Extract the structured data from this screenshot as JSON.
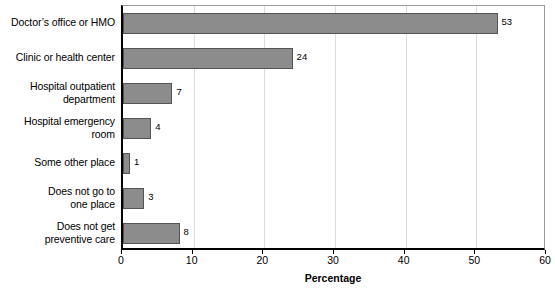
{
  "chart_data": {
    "type": "bar",
    "orientation": "horizontal",
    "title": "",
    "subtitle": "",
    "xlabel": "Percentage",
    "ylabel": "",
    "xlim": [
      0,
      60
    ],
    "xticks": [
      0,
      10,
      20,
      30,
      40,
      50,
      60
    ],
    "grid": "vertical",
    "legend": null,
    "categories": [
      "Doctor’s office or HMO",
      "Clinic or health center",
      "Hospital outpatient department",
      "Hospital emergency room",
      "Some other place",
      "Does not go to one place",
      "Does not get preventive care"
    ],
    "values": [
      53,
      24,
      7,
      4,
      1,
      3,
      8
    ],
    "data_labels": [
      "53",
      "24",
      "7",
      "4",
      "1",
      "3",
      "8"
    ],
    "bar_color": "#8c8c8c",
    "bar_border_color": "#545454",
    "grid_color": "#dcdcdc",
    "axis_color": "#000000"
  },
  "category_label_lines": [
    [
      "Doctor’s office or HMO"
    ],
    [
      "Clinic or health center"
    ],
    [
      "Hospital outpatient",
      "department"
    ],
    [
      "Hospital emergency",
      "room"
    ],
    [
      "Some other place"
    ],
    [
      "Does not go to",
      "one place"
    ],
    [
      "Does not get",
      "preventive care"
    ]
  ],
  "axis": {
    "tick_labels": [
      "0",
      "10",
      "20",
      "30",
      "40",
      "50",
      "60"
    ],
    "title": "Percentage"
  }
}
